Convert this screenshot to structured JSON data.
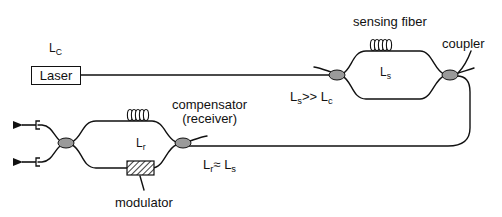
{
  "components": {
    "laser": {
      "label": "Laser",
      "coherence_symbol": "L",
      "coherence_sub": "C"
    },
    "sensing_fiber": {
      "label": "sensing fiber",
      "length_symbol": "L",
      "length_sub": "s"
    },
    "coupler": {
      "label": "coupler"
    },
    "condition_1": {
      "left": "L",
      "left_sub": "s",
      "op": ">>",
      "right": "L",
      "right_sub": "c"
    },
    "compensator": {
      "label_line1": "compensator",
      "label_line2": "(receiver)",
      "length_symbol": "L",
      "length_sub": "r"
    },
    "condition_2": {
      "left": "L",
      "left_sub": "r",
      "op": "≈",
      "right": "L",
      "right_sub": "s"
    },
    "modulator": {
      "label": "modulator"
    },
    "outputs": {
      "count": 2,
      "direction": "left"
    }
  },
  "colors": {
    "line": "#111111",
    "coupler_fill": "#9a9a9a",
    "background": "#ffffff"
  }
}
